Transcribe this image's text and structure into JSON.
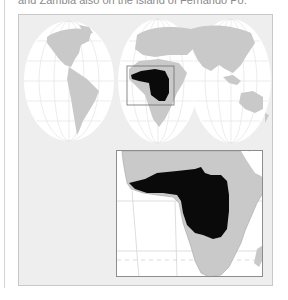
{
  "caption": "and Zambia also on the island of Fernando Po.",
  "map": {
    "projection": "interrupted-world-map",
    "lobes": [
      "americas",
      "europe-africa",
      "asia-australia"
    ],
    "highlight_region": "central-west-africa",
    "colors": {
      "panel_bg": "#eeeeee",
      "ocean": "#ffffff",
      "land": "#c9c9c9",
      "range": "#0a0a0a",
      "grid": "#e2e2e2",
      "frame": "#8d8d8d"
    }
  },
  "inset": {
    "title": "Africa detail",
    "region": "africa"
  }
}
